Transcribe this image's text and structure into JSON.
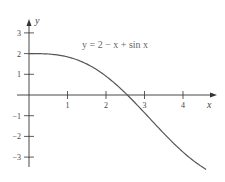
{
  "chart_data": {
    "type": "line",
    "title": "y = 2 − x + sin x",
    "annotation": "y = 2 − x + sin x",
    "xlabel": "x",
    "ylabel": "y",
    "xlim": [
      -0.7,
      4.9
    ],
    "ylim": [
      -3.5,
      3.6
    ],
    "x_ticks": [
      1,
      2,
      3,
      4
    ],
    "x_tick_labels": [
      "1",
      "2",
      "3",
      "4"
    ],
    "y_ticks": [
      3,
      2,
      1,
      -1,
      -2,
      -3
    ],
    "y_tick_labels": [
      "3",
      "2",
      "1",
      "−1",
      "−2",
      "−3"
    ],
    "grid": false,
    "legend": null,
    "series": [
      {
        "name": "y = 2 − x + sin x",
        "function": "2 - x + sin(x)",
        "x_range": [
          0,
          4.6
        ],
        "x": [
          0,
          0.5,
          1,
          1.5,
          2,
          2.5,
          3,
          3.5,
          4,
          4.5,
          4.6
        ],
        "values": [
          2.0,
          1.98,
          1.84,
          1.5,
          0.91,
          0.1,
          -0.86,
          -1.85,
          -2.76,
          -3.48,
          -3.59
        ],
        "color": "#555555"
      }
    ]
  },
  "colors": {
    "axis": "#333333",
    "curve": "#555555",
    "text": "#444444"
  }
}
